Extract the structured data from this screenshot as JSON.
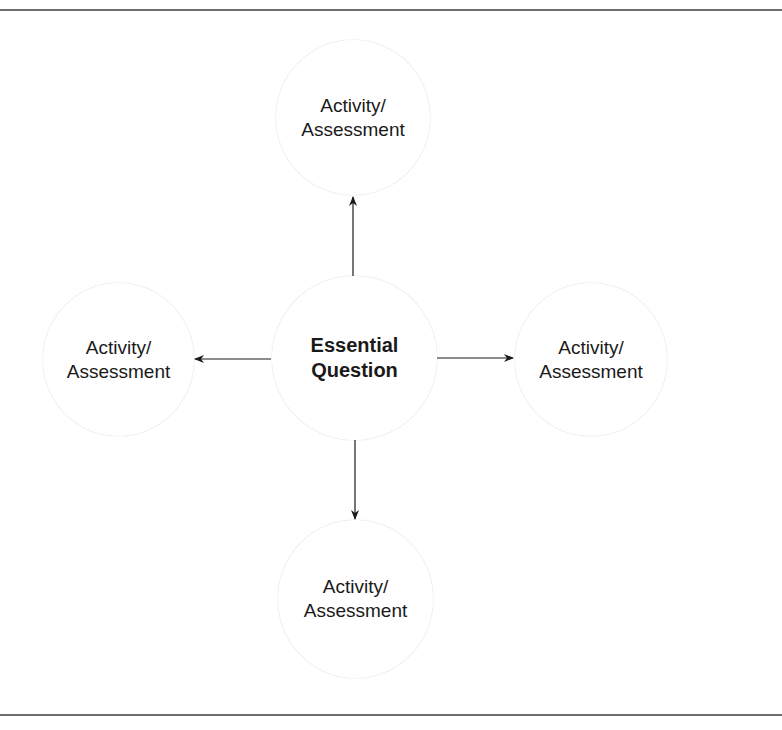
{
  "diagram": {
    "type": "hub-and-spoke",
    "center": {
      "line1": "Essential",
      "line2": "Question"
    },
    "nodes": [
      {
        "position": "top",
        "line1": "Activity/",
        "line2": "Assessment"
      },
      {
        "position": "left",
        "line1": "Activity/",
        "line2": "Assessment"
      },
      {
        "position": "right",
        "line1": "Activity/",
        "line2": "Assessment"
      },
      {
        "position": "bottom",
        "line1": "Activity/",
        "line2": "Assessment"
      }
    ],
    "edges": [
      {
        "from": "center",
        "to": "top",
        "directed": true
      },
      {
        "from": "center",
        "to": "left",
        "directed": true
      },
      {
        "from": "center",
        "to": "right",
        "directed": true
      },
      {
        "from": "center",
        "to": "bottom",
        "directed": true
      }
    ]
  },
  "colors": {
    "rule": "#6e6e6e",
    "arrow": "#1a1a1a",
    "text": "#1a1a1a",
    "circle_rim": "#9a9a9a"
  }
}
